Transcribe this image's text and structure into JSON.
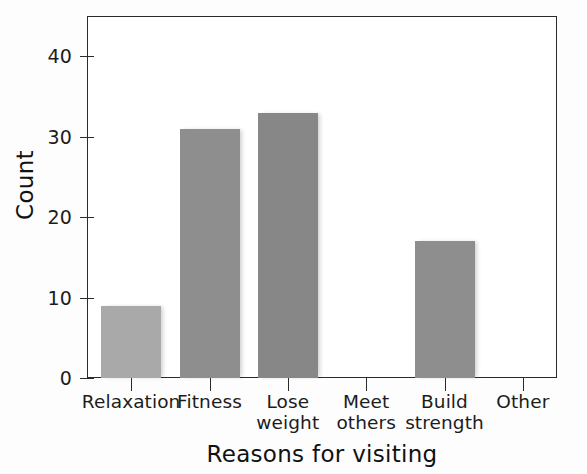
{
  "chart_data": {
    "type": "bar",
    "title": "",
    "categories": [
      "Relaxation",
      "Fitness",
      "Lose weight",
      "Meet others",
      "Build strength",
      "Other"
    ],
    "category_lines": [
      [
        "Relaxation",
        ""
      ],
      [
        "Fitness",
        ""
      ],
      [
        "Lose",
        "weight"
      ],
      [
        "Meet",
        "others"
      ],
      [
        "Build",
        "strength"
      ],
      [
        "Other",
        ""
      ]
    ],
    "values": [
      9,
      31,
      33,
      0,
      17,
      0
    ],
    "xlabel": "Reasons for visiting",
    "ylabel": "Count",
    "ylim": [
      0,
      45
    ],
    "yticks": [
      0,
      10,
      20,
      30,
      40
    ],
    "ytick_labels": [
      "0",
      "10",
      "20",
      "30",
      "40"
    ],
    "grid": false,
    "legend": false,
    "bar_colors": [
      "#a9a9a9",
      "#8e8e8e",
      "#878787",
      "#8e8e8e",
      "#8e8e8e",
      "#8e8e8e"
    ],
    "axis_color": "#2b2b2b",
    "text_color": "#1c1c1c",
    "background": "#ffffff"
  }
}
